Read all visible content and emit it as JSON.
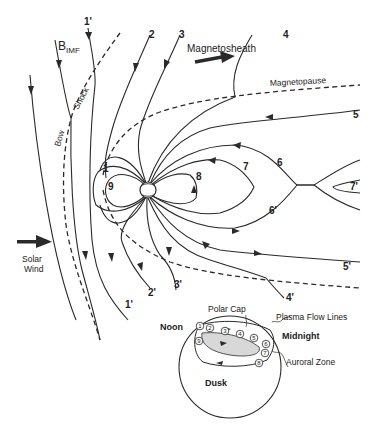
{
  "diagram": {
    "labels": {
      "bimf_main": "B",
      "bimf_sub": "IMF",
      "bow_shock_1": "Bow",
      "bow_shock_2": "Shock",
      "magnetosheath": "Magnetosheath",
      "magnetopause": "Magnetopause",
      "solar_wind_1": "Solar",
      "solar_wind_2": "Wind"
    },
    "field_line_numbers": {
      "n1p_top": "1'",
      "n2": "2",
      "n3": "3",
      "n4": "4",
      "n5": "5",
      "n6": "6",
      "n7": "7",
      "n7p": "7'",
      "n8": "8",
      "n1": "1",
      "n9": "9",
      "n6p": "6'",
      "n5p": "5'",
      "n4p": "4'",
      "n3p": "3'",
      "n2p": "2'",
      "n1p_bottom": "1'"
    },
    "ionosphere_inset": {
      "polar_cap": "Polar Cap",
      "plasma_flow_lines": "Plasma Flow Lines",
      "noon": "Noon",
      "midnight": "Midnight",
      "auroral_zone": "Auroral Zone",
      "dusk": "Dusk",
      "stations": [
        "1",
        "2",
        "3",
        "4",
        "5",
        "6",
        "7",
        "8",
        "9"
      ]
    }
  }
}
